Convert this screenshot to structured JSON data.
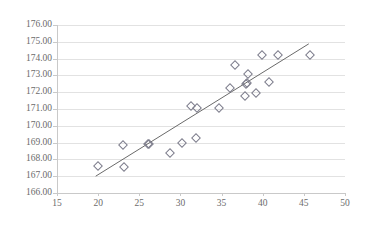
{
  "chart_data": {
    "type": "scatter",
    "title": "",
    "subtitle": "",
    "xlabel": "",
    "ylabel": "",
    "xlim": [
      15,
      50
    ],
    "ylim": [
      166,
      176
    ],
    "xticks": [
      15,
      20,
      25,
      30,
      35,
      40,
      45,
      50
    ],
    "xtick_labels": [
      "15",
      "20",
      "25",
      "30",
      "35",
      "40",
      "45",
      "50"
    ],
    "yticks": [
      166,
      167,
      168,
      169,
      170,
      171,
      172,
      173,
      174,
      175,
      176
    ],
    "ytick_labels": [
      "166.00",
      "167.00",
      "168.00",
      "169.00",
      "170.00",
      "171.00",
      "172.00",
      "173.00",
      "174.00",
      "175.00",
      "176.00"
    ],
    "grid": true,
    "grid_axis": "y",
    "legend": false,
    "legend_position": "none",
    "marker": "diamond-open",
    "marker_color": "#7d7d8c",
    "grid_color": "#e2e2e2",
    "axis_color": "#c9c9c9",
    "text_color": "#6b6b6b",
    "series": [
      {
        "name": "observations",
        "points": [
          [
            20.0,
            167.58
          ],
          [
            23.0,
            168.86
          ],
          [
            23.1,
            167.54
          ],
          [
            26.0,
            168.9
          ],
          [
            26.2,
            168.92
          ],
          [
            28.7,
            168.38
          ],
          [
            30.2,
            169.0
          ],
          [
            31.3,
            171.18
          ],
          [
            31.9,
            169.3
          ],
          [
            32.0,
            171.08
          ],
          [
            34.7,
            171.07
          ],
          [
            36.0,
            172.25
          ],
          [
            36.6,
            173.64
          ],
          [
            37.9,
            171.75
          ],
          [
            38.0,
            172.5
          ],
          [
            38.1,
            172.52
          ],
          [
            38.2,
            173.08
          ],
          [
            39.2,
            171.97
          ],
          [
            39.9,
            174.22
          ],
          [
            40.8,
            172.58
          ],
          [
            41.8,
            174.22
          ],
          [
            45.8,
            174.2
          ]
        ]
      }
    ],
    "trendline": {
      "type": "linear",
      "x_start": 19.7,
      "y_start": 167.0,
      "x_end": 45.6,
      "y_end": 174.88,
      "color": "#6a6a6a"
    }
  }
}
